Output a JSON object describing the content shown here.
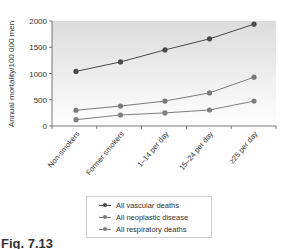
{
  "chart_data": {
    "type": "line",
    "title": "",
    "xlabel": "",
    "ylabel": "Annual mortality/100 000 men",
    "ylim": [
      0,
      2000
    ],
    "yticks": [
      0,
      500,
      1000,
      1500,
      2000
    ],
    "categories": [
      "Non-smokers",
      "Former smokers",
      "1–14 per day",
      "15–24 per day",
      "≥25 per day"
    ],
    "series": [
      {
        "name": "All vascular deaths",
        "color": "#4a4a4a",
        "values": [
          1040,
          1220,
          1450,
          1660,
          1940
        ]
      },
      {
        "name": "All neoplastic disease",
        "color": "#7a7a7a",
        "values": [
          300,
          380,
          475,
          630,
          930
        ]
      },
      {
        "name": "All respiratory deaths",
        "color": "#7f7f7f",
        "values": [
          120,
          210,
          250,
          305,
          475
        ]
      }
    ],
    "grid": false,
    "legend_position": "bottom-center"
  },
  "caption": "Fig. 7.13"
}
